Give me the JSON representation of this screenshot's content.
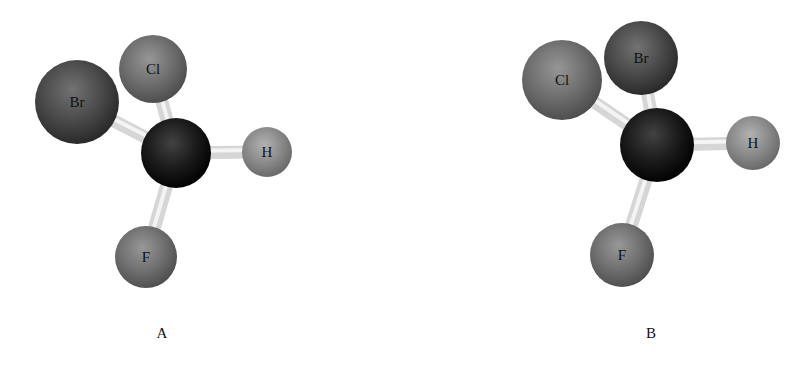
{
  "figure": {
    "models": [
      {
        "id": "A",
        "caption": "A",
        "center_atom": "C",
        "atoms": [
          {
            "key": "Br",
            "label": "Br",
            "element": "bromine"
          },
          {
            "key": "Cl",
            "label": "Cl",
            "element": "chlorine"
          },
          {
            "key": "C",
            "label": "",
            "element": "carbon"
          },
          {
            "key": "H",
            "label": "H",
            "element": "hydrogen"
          },
          {
            "key": "F",
            "label": "F",
            "element": "fluorine"
          }
        ],
        "bonds": [
          [
            "C",
            "Br"
          ],
          [
            "C",
            "Cl"
          ],
          [
            "C",
            "H"
          ],
          [
            "C",
            "F"
          ]
        ]
      },
      {
        "id": "B",
        "caption": "B",
        "center_atom": "C",
        "atoms": [
          {
            "key": "Cl",
            "label": "Cl",
            "element": "chlorine"
          },
          {
            "key": "Br",
            "label": "Br",
            "element": "bromine"
          },
          {
            "key": "C",
            "label": "",
            "element": "carbon"
          },
          {
            "key": "H",
            "label": "H",
            "element": "hydrogen"
          },
          {
            "key": "F",
            "label": "F",
            "element": "fluorine"
          }
        ],
        "bonds": [
          [
            "C",
            "Cl"
          ],
          [
            "C",
            "Br"
          ],
          [
            "C",
            "H"
          ],
          [
            "C",
            "F"
          ]
        ]
      }
    ],
    "colors": {
      "Br": "#4a4a4a",
      "Cl": "#6e6e6e",
      "C": "#1a1a1a",
      "H": "#8a8a8a",
      "F": "#707070",
      "bond": "#d6d6d6",
      "background": "#ffffff",
      "text": "#111111"
    }
  }
}
